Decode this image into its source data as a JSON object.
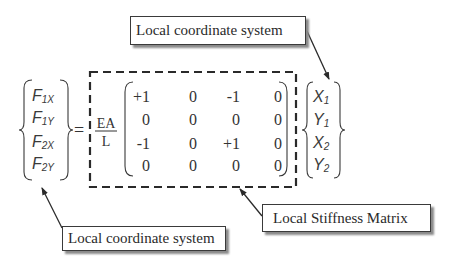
{
  "diagram": {
    "force_vector": {
      "entries": [
        {
          "symbol": "F",
          "sub": "1X"
        },
        {
          "symbol": "F",
          "sub": "1Y"
        },
        {
          "symbol": "F",
          "sub": "2X"
        },
        {
          "symbol": "F",
          "sub": "2Y"
        }
      ]
    },
    "equals": "=",
    "factor": {
      "numerator": "EA",
      "denominator": "L"
    },
    "matrix": {
      "rows": [
        [
          "+1",
          "0",
          "-1",
          "0"
        ],
        [
          "0",
          "0",
          "0",
          "0"
        ],
        [
          "-1",
          "0",
          "+1",
          "0"
        ],
        [
          "0",
          "0",
          "0",
          "0"
        ]
      ]
    },
    "displacement_vector": {
      "entries": [
        {
          "symbol": "X",
          "sub": "1"
        },
        {
          "symbol": "Y",
          "sub": "1"
        },
        {
          "symbol": "X",
          "sub": "2"
        },
        {
          "symbol": "Y",
          "sub": "2"
        }
      ]
    },
    "callouts": {
      "top_right": "Local coordinate system",
      "bottom_left": "Local coordinate system",
      "bottom_right": "Local Stiffness Matrix"
    },
    "colors": {
      "ink": "#2a2a2a",
      "shadow": "#8a8a8a",
      "background": "#ffffff"
    }
  }
}
